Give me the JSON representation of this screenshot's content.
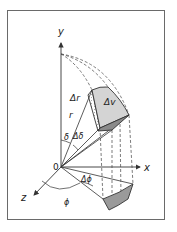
{
  "figure": {
    "labels": {
      "y_axis": "y",
      "x_axis": "x",
      "z_axis": "z",
      "origin": "0",
      "radius": "r",
      "delta_r": "Δr",
      "delta_v": "Δv",
      "theta": "δ",
      "delta_theta": "Δδ",
      "phi": "ϕ",
      "delta_phi": "Δϕ"
    },
    "colors": {
      "frame": "#6a6a6a",
      "line": "#333333",
      "face_light": "#d4d4d4",
      "face_dark": "#8a8a8a",
      "projection_shade": "#9a9a9a"
    }
  }
}
